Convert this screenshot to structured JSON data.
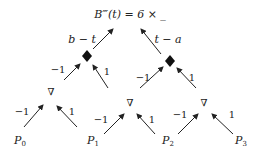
{
  "title": "B‴(t) = 6 × _",
  "top_labels": {
    "left": "b − t",
    "right": "t − a"
  },
  "weights": {
    "neg": "−1",
    "pos": "1"
  },
  "points": [
    "P0",
    "P1",
    "P2",
    "P3"
  ],
  "point_labels": [
    {
      "base": "P",
      "sub": "0"
    },
    {
      "base": "P",
      "sub": "1"
    },
    {
      "base": "P",
      "sub": "2"
    },
    {
      "base": "P",
      "sub": "3"
    }
  ],
  "node_symbols": {
    "difference": "∇",
    "combine": "◆"
  },
  "colors": {
    "ink": "#222222",
    "background": "#ffffff"
  }
}
